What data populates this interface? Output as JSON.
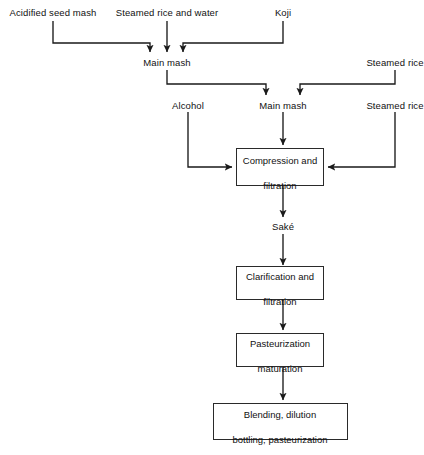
{
  "diagram": {
    "line_color": "#1a1a1a",
    "box_border_color": "#2a2a2a",
    "background": "#ffffff",
    "text_color": "#111111"
  },
  "inputs": {
    "acidified_seed_mash": "Acidified seed mash",
    "steamed_rice_and_water": "Steamed rice and water",
    "koji": "Koji",
    "steamed_rice_top": "Steamed rice",
    "alcohol": "Alcohol",
    "steamed_rice_lower": "Steamed rice"
  },
  "intermediates": {
    "main_mash_1": "Main mash",
    "main_mash_2": "Main mash",
    "sake": "Saké"
  },
  "process_boxes": [
    {
      "id": "compression",
      "line1": "Compression and",
      "line2": "filtration"
    },
    {
      "id": "clarification",
      "line1": "Clarification and",
      "line2": "filtration"
    },
    {
      "id": "pasteurization",
      "line1": "Pasteurization",
      "line2": "maturation"
    },
    {
      "id": "blending",
      "line1": "Blending, dilution",
      "line2": "bottling, pasteurization"
    }
  ]
}
